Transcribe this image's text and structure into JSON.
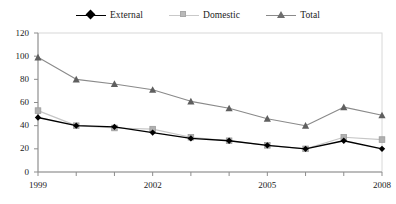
{
  "chart_data": {
    "type": "line",
    "title": "",
    "xlabel": "",
    "ylabel": "",
    "x": [
      1999,
      2000,
      2001,
      2002,
      2003,
      2004,
      2005,
      2006,
      2007,
      2008
    ],
    "categories": [
      "1999",
      "2000",
      "2001",
      "2002",
      "2003",
      "2004",
      "2005",
      "2006",
      "2007",
      "2008"
    ],
    "xtick_labels": [
      "1999",
      "2002",
      "2005",
      "2008"
    ],
    "xtick_values": [
      1999,
      2002,
      2005,
      2008
    ],
    "ytick_labels": [
      "0",
      "20",
      "40",
      "60",
      "80",
      "100",
      "120"
    ],
    "ytick_values": [
      0,
      20,
      40,
      60,
      80,
      100,
      120
    ],
    "ylim": [
      0,
      120
    ],
    "xlim": [
      1999,
      2008
    ],
    "grid": false,
    "legend_position": "top-center",
    "series": [
      {
        "name": "External",
        "color": "#000000",
        "marker": "diamond",
        "values": [
          47,
          40,
          39,
          34,
          29,
          27,
          23,
          20,
          27,
          20
        ]
      },
      {
        "name": "Domestic",
        "color": "#b9b9b9",
        "marker": "square",
        "values": [
          53,
          40,
          38,
          37,
          30,
          27,
          23,
          20,
          30,
          28
        ]
      },
      {
        "name": "Total",
        "color": "#6e6e6e",
        "marker": "triangle",
        "values": [
          99,
          80,
          76,
          71,
          61,
          55,
          46,
          40,
          56,
          49
        ]
      }
    ]
  },
  "legend": {
    "items": [
      {
        "label": "External",
        "marker": "diamond-marker",
        "color": "#000000"
      },
      {
        "label": "Domestic",
        "marker": "square-marker",
        "color": "#b9b9b9"
      },
      {
        "label": "Total",
        "marker": "triangle-marker",
        "color": "#6e6e6e"
      }
    ]
  },
  "axes": {
    "y_labels": [
      "120",
      "100",
      "80",
      "60",
      "40",
      "20",
      "0"
    ],
    "x_labels": [
      "1999",
      "2002",
      "2005",
      "2008"
    ],
    "axis_color": "#8d8d8d"
  }
}
